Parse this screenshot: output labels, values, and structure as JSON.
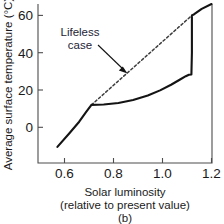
{
  "chart_data": {
    "type": "line",
    "title": "",
    "panel_label": "(b)",
    "xlabel_line1": "Solar luminosity",
    "xlabel_line2": "(relative to present value)",
    "ylabel": "Average surface temperature (°C)",
    "xlim": [
      0.5,
      1.2
    ],
    "ylim": [
      -12,
      68
    ],
    "grid": false,
    "legend_position": "none",
    "xticks": [
      0.6,
      0.8,
      1.0,
      1.2
    ],
    "xtick_labels": [
      "0.6",
      "0.8",
      "1.0",
      "1.2"
    ],
    "yticks": [
      0,
      20,
      40,
      60
    ],
    "ytick_labels": [
      "0",
      "20",
      "40",
      "60"
    ],
    "annotations": [
      {
        "name": "lifeless-case",
        "text_line1": "Lifeless",
        "text_line2": "case",
        "points_to_x": 0.855,
        "points_to_y": 33.5
      }
    ],
    "series": [
      {
        "name": "regulated-case",
        "style": "solid",
        "color": "#141414",
        "points": [
          [
            0.571,
            -10.5
          ],
          [
            0.62,
            -3.2
          ],
          [
            0.66,
            3.0
          ],
          [
            0.69,
            8.5
          ],
          [
            0.71,
            12.0
          ],
          [
            0.76,
            12.2
          ],
          [
            0.82,
            13.0
          ],
          [
            0.88,
            14.6
          ],
          [
            0.94,
            17.0
          ],
          [
            0.99,
            19.8
          ],
          [
            1.035,
            22.8
          ],
          [
            1.07,
            25.5
          ],
          [
            1.095,
            27.4
          ],
          [
            1.108,
            28.2
          ],
          [
            1.118,
            28.3
          ],
          [
            1.12,
            40.0
          ],
          [
            1.12,
            60.0
          ],
          [
            1.128,
            60.5
          ],
          [
            1.16,
            63.5
          ],
          [
            1.2,
            68.0
          ]
        ]
      },
      {
        "name": "lifeless-case",
        "style": "dashed",
        "color": "#3d3d3d",
        "points": [
          [
            0.71,
            12.0
          ],
          [
            1.12,
            60.0
          ]
        ]
      }
    ]
  },
  "figure": {
    "axis_color": "#4d4d4d",
    "text_color": "#1a1a1a"
  }
}
